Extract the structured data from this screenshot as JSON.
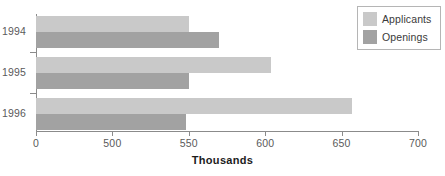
{
  "chart_data": {
    "type": "bar",
    "orientation": "horizontal",
    "title": "",
    "xlabel": "Thousands",
    "ylabel": "",
    "categories": [
      "1994",
      "1995",
      "1996"
    ],
    "series": [
      {
        "name": "Applicants",
        "color": "#c9c9c9",
        "values": [
          550,
          604,
          657
        ]
      },
      {
        "name": "Openings",
        "color": "#a2a2a2",
        "values": [
          570,
          550,
          548
        ]
      }
    ],
    "xticks": [
      {
        "label": "0",
        "value": 0
      },
      {
        "label": "500",
        "value": 500
      },
      {
        "label": "550",
        "value": 550
      },
      {
        "label": "600",
        "value": 600
      },
      {
        "label": "650",
        "value": 650
      },
      {
        "label": "700",
        "value": 700
      }
    ],
    "xlim": [
      0,
      700
    ],
    "axis_note": "broken / non-linear x axis: ticks 0,500,550,600,650,700 evenly spaced",
    "grid": false,
    "legend_position": "top-right",
    "legend": [
      "Applicants",
      "Openings"
    ]
  }
}
